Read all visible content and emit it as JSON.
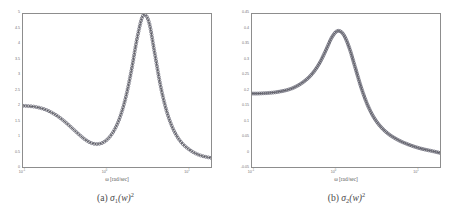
{
  "figure": {
    "panels": [
      {
        "id": "panel-a",
        "caption_prefix": "(a)",
        "caption_symbol": "σ",
        "caption_sub": "1",
        "caption_arg": "(w)",
        "caption_sup": "2",
        "caption_full": "(a) σ1(w)²",
        "xlabel": "ω [rad/sec]",
        "ytick_labels": [
          "5",
          "4.5",
          "4",
          "3.5",
          "3",
          "2.5",
          "2",
          "1.5",
          "1",
          "0.5",
          "0"
        ],
        "xtick_labels": [
          "10⁻¹",
          "10⁰",
          "10¹"
        ],
        "xtick_exponents": [
          "-1",
          "0",
          "1"
        ],
        "line_color": "#3c3c3c",
        "marker_color": "#5c5c6a",
        "axis_color": "#8d8d8d"
      },
      {
        "id": "panel-b",
        "caption_prefix": "(b)",
        "caption_symbol": "σ",
        "caption_sub": "2",
        "caption_arg": "(w)",
        "caption_sup": "2",
        "caption_full": "(b) σ2(w)²",
        "xlabel": "ω [rad/sec]",
        "ytick_labels": [
          "0.45",
          "0.4",
          "0.35",
          "0.3",
          "0.25",
          "0.2",
          "0.15",
          "0.1",
          "0.05",
          "0",
          "-0.05"
        ],
        "xtick_labels": [
          "10⁻¹",
          "10⁰",
          "10¹"
        ],
        "xtick_exponents": [
          "-1",
          "0",
          "1"
        ],
        "line_color": "#3c3c3c",
        "marker_color": "#5c5c6a",
        "axis_color": "#8d8d8d"
      }
    ]
  },
  "chart_data": [
    {
      "type": "line",
      "title": "(a) σ1(w)²",
      "xlabel": "ω [rad/sec]",
      "ylabel": "",
      "xscale": "log",
      "xlim": [
        0.1,
        20
      ],
      "ylim": [
        0,
        5
      ],
      "grid": false,
      "legend": "none",
      "markers": "circle",
      "series": [
        {
          "name": "σ1(w)²",
          "x": [
            0.1,
            0.118,
            0.138,
            0.162,
            0.191,
            0.224,
            0.263,
            0.309,
            0.363,
            0.426,
            0.501,
            0.589,
            0.692,
            0.813,
            0.955,
            1.122,
            1.318,
            1.549,
            1.82,
            2.138,
            2.512,
            2.951,
            3.467,
            4.074,
            4.786,
            5.623,
            6.607,
            7.762,
            9.12,
            10.715,
            12.589,
            14.791,
            17.378,
            20.0
          ],
          "y": [
            2.0,
            1.99,
            1.97,
            1.93,
            1.87,
            1.78,
            1.67,
            1.53,
            1.37,
            1.2,
            1.03,
            0.88,
            0.78,
            0.75,
            0.8,
            0.95,
            1.22,
            1.65,
            2.3,
            3.2,
            4.25,
            4.95,
            4.75,
            3.75,
            2.7,
            1.9,
            1.35,
            0.98,
            0.74,
            0.58,
            0.46,
            0.38,
            0.33,
            0.3
          ]
        }
      ]
    },
    {
      "type": "line",
      "title": "(b) σ2(w)²",
      "xlabel": "ω [rad/sec]",
      "ylabel": "",
      "xscale": "log",
      "xlim": [
        0.1,
        20
      ],
      "ylim": [
        -0.05,
        0.45
      ],
      "grid": false,
      "legend": "none",
      "markers": "circle",
      "series": [
        {
          "name": "σ2(w)²",
          "x": [
            0.1,
            0.118,
            0.138,
            0.162,
            0.191,
            0.224,
            0.263,
            0.309,
            0.363,
            0.426,
            0.501,
            0.589,
            0.692,
            0.813,
            0.955,
            1.122,
            1.318,
            1.549,
            1.82,
            2.138,
            2.512,
            2.951,
            3.467,
            4.074,
            4.786,
            5.623,
            6.607,
            7.762,
            9.12,
            10.715,
            12.589,
            14.791,
            17.378,
            20.0
          ],
          "y": [
            0.19,
            0.19,
            0.191,
            0.192,
            0.194,
            0.197,
            0.201,
            0.207,
            0.216,
            0.228,
            0.244,
            0.266,
            0.296,
            0.335,
            0.375,
            0.395,
            0.383,
            0.34,
            0.278,
            0.215,
            0.162,
            0.122,
            0.093,
            0.072,
            0.056,
            0.044,
            0.034,
            0.026,
            0.019,
            0.013,
            0.008,
            0.004,
            0.0,
            -0.004
          ]
        }
      ]
    }
  ]
}
